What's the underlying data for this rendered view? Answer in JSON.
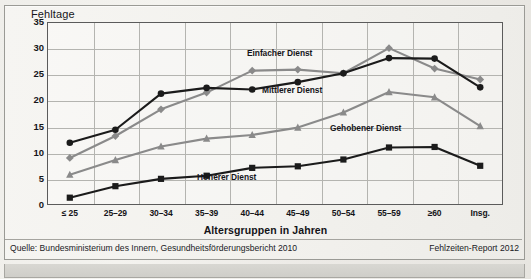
{
  "figure": {
    "y_axis_title": "Fehltage",
    "x_axis_title": "Altersgruppen in Jahren",
    "source_note": "Quelle: Bundesministerium des Innern, Gesundheitsförderungsbericht 2010",
    "report_note": "Fehlzeiten-Report 2012"
  },
  "series_labels": {
    "einfacher": "Einfacher Dienst",
    "mittlerer": "Mittlerer Dienst",
    "gehobener": "Gehobener Dienst",
    "hoeherer": "Höherer Dienst"
  },
  "colors": {
    "gray_series": "#8a8a8a",
    "black_series": "#1b1b1b",
    "grid": "#b4b4b0",
    "axis": "#5b5b5b",
    "paper": "#f2f1ed"
  },
  "chart_data": {
    "type": "line",
    "title": "Fehltage",
    "xlabel": "Altersgruppen in Jahren",
    "ylabel": "Fehltage",
    "ylim": [
      0,
      35
    ],
    "ytick_step": 5,
    "yticks": [
      0,
      5,
      10,
      15,
      20,
      25,
      30,
      35
    ],
    "grid": true,
    "legend": "inline-labels",
    "categories": [
      "≤ 25",
      "25–29",
      "30–34",
      "35–39",
      "40–44",
      "45–49",
      "50–54",
      "55–59",
      "≥60",
      "Insg."
    ],
    "series": [
      {
        "name": "Einfacher Dienst",
        "color": "#8a8a8a",
        "marker": "diamond",
        "values": [
          9.0,
          13.2,
          18.3,
          21.5,
          25.7,
          25.9,
          25.2,
          30.0,
          26.1,
          24.0
        ]
      },
      {
        "name": "Mittlerer Dienst",
        "color": "#1b1b1b",
        "marker": "circle",
        "values": [
          11.9,
          14.4,
          21.3,
          22.4,
          22.1,
          23.5,
          25.2,
          28.1,
          28.0,
          22.5
        ]
      },
      {
        "name": "Gehobener Dienst",
        "color": "#8a8a8a",
        "marker": "triangle",
        "values": [
          5.8,
          8.6,
          11.2,
          12.7,
          13.4,
          14.8,
          17.7,
          21.6,
          20.6,
          15.1
        ]
      },
      {
        "name": "Höherer Dienst",
        "color": "#1b1b1b",
        "marker": "square",
        "values": [
          1.4,
          3.6,
          5.0,
          5.6,
          7.1,
          7.4,
          8.7,
          11.0,
          11.1,
          7.5
        ]
      }
    ]
  }
}
